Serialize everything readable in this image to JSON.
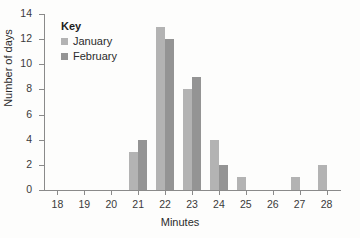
{
  "chart_data": {
    "type": "bar",
    "title": "",
    "xlabel": "Minutes",
    "ylabel": "Number of days",
    "categories": [
      "18",
      "19",
      "20",
      "21",
      "22",
      "23",
      "24",
      "25",
      "26",
      "27",
      "28"
    ],
    "series": [
      {
        "name": "January",
        "values": [
          0,
          0,
          0,
          3,
          13,
          8,
          4,
          1,
          0,
          1,
          2
        ],
        "color": "#b3b3b3"
      },
      {
        "name": "February",
        "values": [
          0,
          0,
          0,
          4,
          12,
          9,
          2,
          0,
          0,
          0,
          0
        ],
        "color": "#949494"
      }
    ],
    "ylim": [
      0,
      14
    ],
    "yticks": [
      0,
      2,
      4,
      6,
      8,
      10,
      12,
      14
    ],
    "xlim": [
      17.5,
      28.5
    ],
    "grid": false,
    "legend_position": "top-left",
    "legend_title": "Key"
  },
  "axes": {
    "x_title": "Minutes",
    "y_title": "Number of days"
  },
  "legend": {
    "title": "Key",
    "entries": [
      {
        "label": "January"
      },
      {
        "label": "February"
      }
    ]
  }
}
